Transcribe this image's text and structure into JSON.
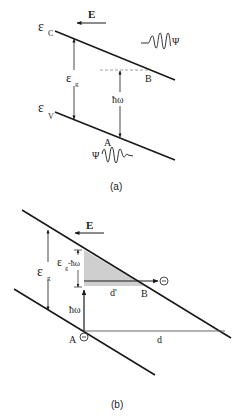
{
  "panel_a": {
    "caption": "(a)",
    "field_label": "E",
    "conduction_band_label": "ε",
    "conduction_band_sub": "C",
    "valence_band_label": "ε",
    "valence_band_sub": "V",
    "gap_label": "ε",
    "gap_sub": "g",
    "photon_energy_label": "ħω",
    "point_a_label": "A",
    "point_b_label": "B",
    "wavefunction_label_top": "Ψ",
    "wavefunction_label_bottom": "Ψ"
  },
  "panel_b": {
    "caption": "(b)",
    "field_label": "E",
    "gap_label": "ε",
    "gap_sub": "g",
    "deficit_label": "ε",
    "deficit_sub": "g",
    "deficit_suffix": "-ħω",
    "photon_energy_label": "ħω",
    "point_a_label": "A",
    "point_b_label": "B",
    "tunnel_distance_label": "d'",
    "total_distance_label": "d",
    "electron_symbol": "−"
  },
  "colors": {
    "line": "#1a1a1a",
    "shade": "#cfcfcf",
    "dashed": "#777777"
  }
}
